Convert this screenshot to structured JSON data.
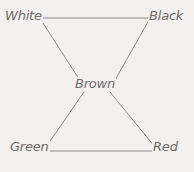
{
  "diagram": {
    "type": "node-link-graph",
    "background_color": "#f3f1ef",
    "line_color": "#8d8b8a",
    "text_color": "#6e6c6b",
    "nodes": [
      {
        "id": "white",
        "label": "White",
        "x": 24,
        "y": 17
      },
      {
        "id": "black",
        "label": "Black",
        "x": 168,
        "y": 17
      },
      {
        "id": "brown",
        "label": "Brown",
        "x": 96,
        "y": 85
      },
      {
        "id": "green",
        "label": "Green",
        "x": 28,
        "y": 148
      },
      {
        "id": "red",
        "label": "Red",
        "x": 167,
        "y": 148
      }
    ],
    "edges": [
      {
        "from": "white",
        "to": "black",
        "x1": 41,
        "y1": 18,
        "x2": 150,
        "y2": 18
      },
      {
        "from": "white",
        "to": "brown",
        "x1": 41,
        "y1": 20,
        "x2": 79,
        "y2": 79
      },
      {
        "from": "black",
        "to": "brown",
        "x1": 149,
        "y1": 20,
        "x2": 114,
        "y2": 82
      },
      {
        "from": "brown",
        "to": "green",
        "x1": 84,
        "y1": 92,
        "x2": 46,
        "y2": 147
      },
      {
        "from": "brown",
        "to": "red",
        "x1": 110,
        "y1": 92,
        "x2": 155,
        "y2": 147
      },
      {
        "from": "green",
        "to": "red",
        "x1": 45,
        "y1": 151,
        "x2": 154,
        "y2": 151
      }
    ]
  }
}
